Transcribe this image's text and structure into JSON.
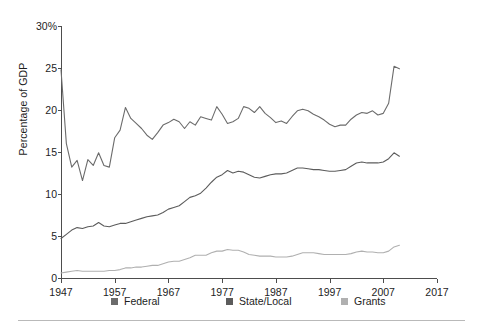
{
  "chart_data": {
    "type": "line",
    "title": "",
    "subtitle": "",
    "xlabel": "",
    "ylabel": "Percentage of GDP",
    "xlim": [
      1947,
      2017
    ],
    "ylim": [
      0,
      30
    ],
    "grid": false,
    "legend_position": "bottom",
    "x_ticks": [
      "1947",
      "1957",
      "1967",
      "1977",
      "1987",
      "1997",
      "2007",
      "2017"
    ],
    "x_tick_values": [
      1947,
      1957,
      1967,
      1977,
      1987,
      1997,
      2007,
      2017
    ],
    "y_ticks": [
      "0",
      "5",
      "10",
      "15",
      "20",
      "25",
      "30%"
    ],
    "y_tick_values": [
      0,
      5,
      10,
      15,
      20,
      25,
      30
    ],
    "x": [
      1947,
      1948,
      1949,
      1950,
      1951,
      1952,
      1953,
      1954,
      1955,
      1956,
      1957,
      1958,
      1959,
      1960,
      1961,
      1962,
      1963,
      1964,
      1965,
      1966,
      1967,
      1968,
      1969,
      1970,
      1971,
      1972,
      1973,
      1974,
      1975,
      1976,
      1977,
      1978,
      1979,
      1980,
      1981,
      1982,
      1983,
      1984,
      1985,
      1986,
      1987,
      1988,
      1989,
      1990,
      1991,
      1992,
      1993,
      1994,
      1995,
      1996,
      1997,
      1998,
      1999,
      2000,
      2001,
      2002,
      2003,
      2004,
      2005,
      2006,
      2007,
      2008,
      2009,
      2010
    ],
    "series": [
      {
        "name": "Federal",
        "color": "#6b6b6b",
        "values": [
          24.8,
          16.0,
          13.2,
          14.0,
          11.6,
          14.1,
          13.4,
          14.9,
          13.4,
          13.2,
          16.7,
          17.6,
          20.3,
          19.0,
          18.4,
          17.8,
          17.0,
          16.5,
          17.3,
          18.2,
          18.5,
          18.9,
          18.6,
          17.8,
          18.6,
          18.2,
          19.2,
          19.0,
          18.8,
          20.4,
          19.5,
          18.4,
          18.6,
          19.0,
          20.4,
          20.2,
          19.7,
          20.4,
          19.6,
          19.1,
          18.5,
          18.7,
          18.4,
          19.2,
          19.9,
          20.1,
          19.9,
          19.5,
          19.2,
          18.8,
          18.3,
          18.0,
          18.2,
          18.2,
          18.9,
          19.4,
          19.7,
          19.6,
          19.9,
          19.4,
          19.6,
          20.8,
          25.2,
          24.9
        ]
      },
      {
        "name": "State/Local",
        "color": "#5c5c5c",
        "values": [
          4.7,
          5.2,
          5.7,
          6.0,
          5.9,
          6.1,
          6.2,
          6.6,
          6.2,
          6.1,
          6.3,
          6.5,
          6.5,
          6.7,
          6.9,
          7.1,
          7.3,
          7.4,
          7.5,
          7.8,
          8.2,
          8.4,
          8.6,
          9.1,
          9.6,
          9.8,
          10.1,
          10.7,
          11.4,
          12.0,
          12.3,
          12.8,
          12.5,
          12.7,
          12.6,
          12.3,
          12.0,
          11.9,
          12.1,
          12.3,
          12.4,
          12.4,
          12.5,
          12.8,
          13.1,
          13.1,
          13.0,
          12.9,
          12.9,
          12.8,
          12.7,
          12.7,
          12.8,
          12.9,
          13.3,
          13.7,
          13.8,
          13.7,
          13.7,
          13.7,
          13.8,
          14.2,
          14.9,
          14.5
        ]
      },
      {
        "name": "Grants",
        "color": "#b0b0b0",
        "values": [
          0.6,
          0.7,
          0.8,
          0.9,
          0.8,
          0.8,
          0.8,
          0.8,
          0.8,
          0.9,
          0.9,
          1.0,
          1.2,
          1.2,
          1.3,
          1.3,
          1.4,
          1.5,
          1.5,
          1.7,
          1.9,
          2.0,
          2.0,
          2.2,
          2.4,
          2.7,
          2.7,
          2.7,
          3.0,
          3.2,
          3.2,
          3.4,
          3.3,
          3.3,
          3.1,
          2.8,
          2.7,
          2.6,
          2.6,
          2.6,
          2.5,
          2.5,
          2.5,
          2.6,
          2.8,
          3.0,
          3.0,
          3.0,
          2.9,
          2.8,
          2.8,
          2.8,
          2.8,
          2.8,
          2.9,
          3.1,
          3.2,
          3.1,
          3.1,
          3.0,
          3.0,
          3.2,
          3.7,
          3.9
        ]
      }
    ],
    "legend": [
      {
        "label": "Federal",
        "color": "#6b6b6b"
      },
      {
        "label": "State/Local",
        "color": "#5c5c5c"
      },
      {
        "label": "Grants",
        "color": "#b0b0b0"
      }
    ]
  },
  "axis": {
    "line_color": "#4d4d4d",
    "tick_color": "#4d4d4d"
  },
  "footer": {
    "rule_color": "#b9b9b9"
  }
}
